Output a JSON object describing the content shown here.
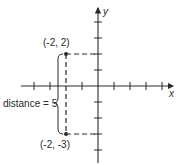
{
  "diagram": {
    "type": "coordinate-plane",
    "axes": {
      "x_label": "x",
      "y_label": "y",
      "x_ticks": [
        -4,
        -3,
        -2,
        -1,
        1,
        2,
        3,
        4
      ],
      "y_ticks": [
        -4,
        -3,
        -2,
        -1,
        1,
        2,
        3,
        4
      ]
    },
    "points": [
      {
        "x": -2,
        "y": 2,
        "label": "(-2, 2)"
      },
      {
        "x": -2,
        "y": -3,
        "label": "(-2, -3)"
      }
    ],
    "annotation": {
      "text": "distance = 5"
    },
    "colors": {
      "ink": "#2a2a2a",
      "background": "#ffffff"
    }
  }
}
